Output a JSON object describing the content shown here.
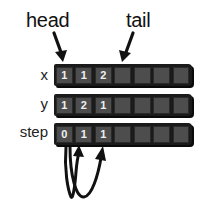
{
  "labels": {
    "head": "head",
    "tail": "tail"
  },
  "arrays": [
    {
      "name": "x",
      "cells": [
        "1",
        "1",
        "2",
        "",
        "",
        "",
        ""
      ]
    },
    {
      "name": "y",
      "cells": [
        "1",
        "2",
        "1",
        "",
        "",
        "",
        ""
      ]
    },
    {
      "name": "step",
      "cells": [
        "0",
        "1",
        "1",
        "",
        "",
        "",
        ""
      ]
    }
  ],
  "colors": {
    "cell_fill": "#4d4d4d",
    "array_frame": "#1a1a1a",
    "text": "#111111"
  }
}
